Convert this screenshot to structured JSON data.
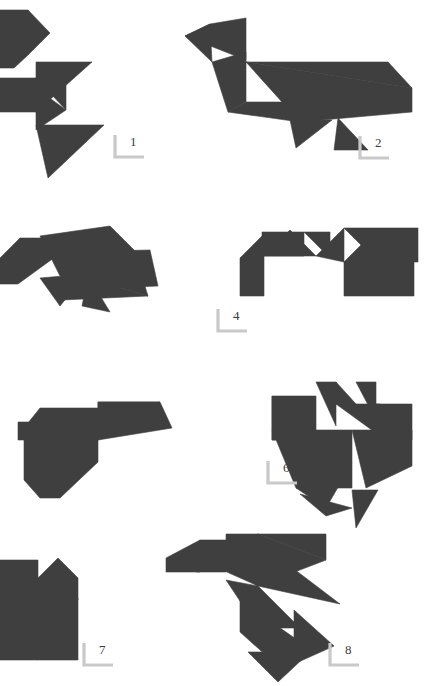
{
  "page": {
    "kind": "tangram-figure-plate",
    "width": 435,
    "height": 686,
    "background_color": "#ffffff",
    "figure_fill_color": "#3f3f3f",
    "label_bracket_color": "#c9c9c9",
    "label_text_color": "#3b3b3b",
    "figure_count": 8
  },
  "figures": [
    {
      "id": "figure-1",
      "label": "1",
      "subject": "tangram-bird-standing",
      "label_x": 113,
      "label_y": 134,
      "polygons": [
        "0,10 28,10 28,55 14,68 0,68",
        "28,10 28,55 50,33",
        "0,78 36,78 36,112 0,112",
        "36,78 66,78 66,110",
        "0,95 36,78 36,112",
        "36,88 36,130 66,110",
        "36,62 36,112 92,62",
        "36,125 104,125 48,178"
      ]
    },
    {
      "id": "figure-2",
      "label": "2",
      "subject": "tangram-long-necked-bird",
      "label_x": 358,
      "label_y": 135,
      "polygons": [
        "210,24 246,18 246,60 185,36",
        "210,24 185,36 212,62",
        "212,62 246,52 246,102 228,112",
        "228,112 246,102 322,102 300,122",
        "246,62 412,88 412,112 300,122",
        "246,62 412,88 388,62",
        "290,120 332,120 296,148",
        "338,118 368,150 334,150"
      ]
    },
    {
      "id": "figure-3",
      "label": "",
      "subject": "tangram-pecking-bird",
      "label_x": null,
      "label_y": null,
      "polygons": [
        "0,258 20,238 52,238 62,252 18,284 0,284",
        "40,236 110,226 146,262 60,276",
        "54,252 150,250 158,286 66,290",
        "66,272 140,270 148,296",
        "66,272 148,296 62,300",
        "40,278 86,274 60,306",
        "88,276 110,312 82,306"
      ]
    },
    {
      "id": "figure-4",
      "label": "4",
      "subject": "tangram-zigzag-bird",
      "label_x": 216,
      "label_y": 308,
      "polygons": [
        "262,232 304,232 304,256 262,256",
        "240,258 264,234 264,258",
        "240,258 264,258 264,296 240,296",
        "264,256 290,230 316,256",
        "304,232 330,232 330,258",
        "316,256 344,228 344,262",
        "344,228 378,228 378,262",
        "378,228 418,228 418,262 344,262",
        "344,262 380,262 380,296 344,296",
        "380,262 414,262 414,296 380,296"
      ]
    },
    {
      "id": "figure-5",
      "label": "",
      "subject": "tangram-sitting-hen",
      "label_x": null,
      "label_y": null,
      "polygons": [
        "18,422 54,422 54,440 18,440",
        "40,408 98,408 98,462 60,498 40,498 24,480 24,428",
        "98,402 160,402 98,440",
        "98,402 160,402 172,428 98,440"
      ]
    },
    {
      "id": "figure-6",
      "label": "6",
      "subject": "tangram-crowing-rooster",
      "label_x": 266,
      "label_y": 460,
      "polygons": [
        "272,396 316,396 316,440 272,440",
        "272,396 316,440 272,440",
        "316,382 336,382 336,426",
        "336,404 336,382 356,404",
        "356,382 376,382 376,420",
        "336,404 380,404 380,436",
        "376,404 412,404 412,440 376,440",
        "272,430 352,430 352,488 296,488",
        "352,430 412,430 412,466 366,488",
        "296,488 348,470 326,508",
        "300,494 352,508 326,516",
        "352,490 378,490 356,528"
      ]
    },
    {
      "id": "figure-7",
      "label": "7",
      "subject": "tangram-bird-partial-left",
      "label_x": 82,
      "label_y": 642,
      "polygons": [
        "0,578 38,578 38,612 0,612",
        "0,560 38,560 38,578 0,578",
        "38,578 58,558 78,578 78,600 38,612",
        "38,598 78,598 78,660 38,660",
        "0,612 38,598 38,660 0,660",
        "0,640 38,612 38,660"
      ]
    },
    {
      "id": "figure-8",
      "label": "8",
      "subject": "tangram-diving-bird",
      "label_x": 328,
      "label_y": 642,
      "polygons": [
        "200,540 226,540 226,572 196,572",
        "166,558 200,540 200,572 166,572",
        "226,534 258,534 258,566 226,566",
        "200,560 258,534 326,560 258,586",
        "258,534 326,560 326,534",
        "226,566 290,566 340,604 258,586",
        "226,580 258,586 300,628 258,628",
        "240,600 306,646 280,668 240,632",
        "294,610 334,646 294,664",
        "248,652 310,652 278,682"
      ]
    }
  ]
}
